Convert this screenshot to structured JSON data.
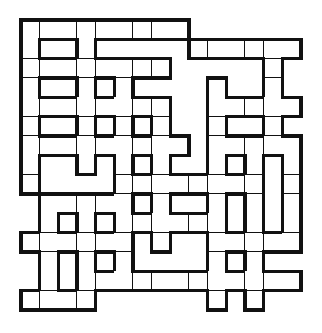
{
  "puzzle": {
    "type": "crossword-grid",
    "rows": 15,
    "cols": 15,
    "legend": {
      "c": "white-cell",
      "x": "block-or-outside"
    },
    "grid": [
      "ccccccccc xxxxx x",
      "cxxcxxxxxcccccc",
      "ccccccccxxxxxcx",
      "cxxcxcxxxxcxxcx",
      "ccccccccxxccccc",
      "cxxcxcxcxxcxxcx",
      "ccccccccc xccccc",
      "cxxcxcxcxxcxcxc",
      "cxxxxccccccccxc",
      "xccccc xcxxcxcxc",
      "xcxcxcccccc xcxc",
      "ccccccxcxxccccc",
      "xcxcxcxxxxcxcxx",
      "xcxccccccccccccc",
      "ccccxxxxxxcxcxx"
    ],
    "colors": {
      "line": "#111111",
      "cell": "#ffffff",
      "background": "#ffffff"
    }
  }
}
